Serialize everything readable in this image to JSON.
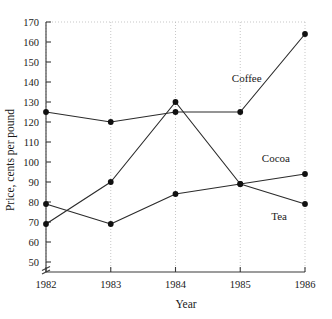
{
  "chart_data": {
    "type": "line",
    "title": "",
    "xlabel": "Year",
    "ylabel": "Price, cents per pound",
    "categories": [
      "1982",
      "1983",
      "1984",
      "1985",
      "1986"
    ],
    "x": [
      1982,
      1983,
      1984,
      1985,
      1986
    ],
    "xlim": [
      1982,
      1986
    ],
    "ylim": [
      45,
      170
    ],
    "yticks": [
      50,
      60,
      70,
      80,
      90,
      100,
      110,
      120,
      130,
      140,
      150,
      160,
      170
    ],
    "ytick_labels": [
      "50",
      "60",
      "70",
      "80",
      "90",
      "100",
      "110",
      "120",
      "130",
      "140",
      "150",
      "160",
      "170"
    ],
    "xticks": [
      1982,
      1983,
      1984,
      1985,
      1986
    ],
    "xtick_labels": [
      "1982",
      "1983",
      "1984",
      "1985",
      "1986"
    ],
    "grid": "vertical-dotted-plus-top-dotted",
    "legend_position": "inline-right-of-series",
    "y_axis_break": true,
    "y_axis_break_label": "//",
    "series": [
      {
        "name": "Coffee",
        "label": "Coffee",
        "values": [
          125,
          120,
          125,
          125,
          164
        ],
        "marker": "filled-circle",
        "color": "#2b2b2b"
      },
      {
        "name": "Cocoa",
        "label": "Cocoa",
        "values": [
          79,
          69,
          84,
          89,
          94
        ],
        "marker": "filled-circle",
        "color": "#2b2b2b"
      },
      {
        "name": "Tea",
        "label": "Tea",
        "values": [
          69,
          90,
          130,
          89,
          79
        ],
        "marker": "filled-circle",
        "color": "#2b2b2b"
      }
    ],
    "annotations": [
      {
        "text": "Coffee",
        "x": 1985.1,
        "y": 140,
        "series": "Coffee"
      },
      {
        "text": "Cocoa",
        "x": 1985.55,
        "y": 100,
        "series": "Cocoa"
      },
      {
        "text": "Tea",
        "x": 1985.6,
        "y": 71,
        "series": "Tea"
      }
    ]
  },
  "axis": {
    "x_title": "Year",
    "y_title": "Price, cents per pound"
  },
  "colors": {
    "line": "#2b2b2b",
    "marker": "#111111",
    "grid": "#b9b9b9",
    "axis": "#3a3a3a",
    "text": "#1a1a1a",
    "background": "#ffffff"
  }
}
